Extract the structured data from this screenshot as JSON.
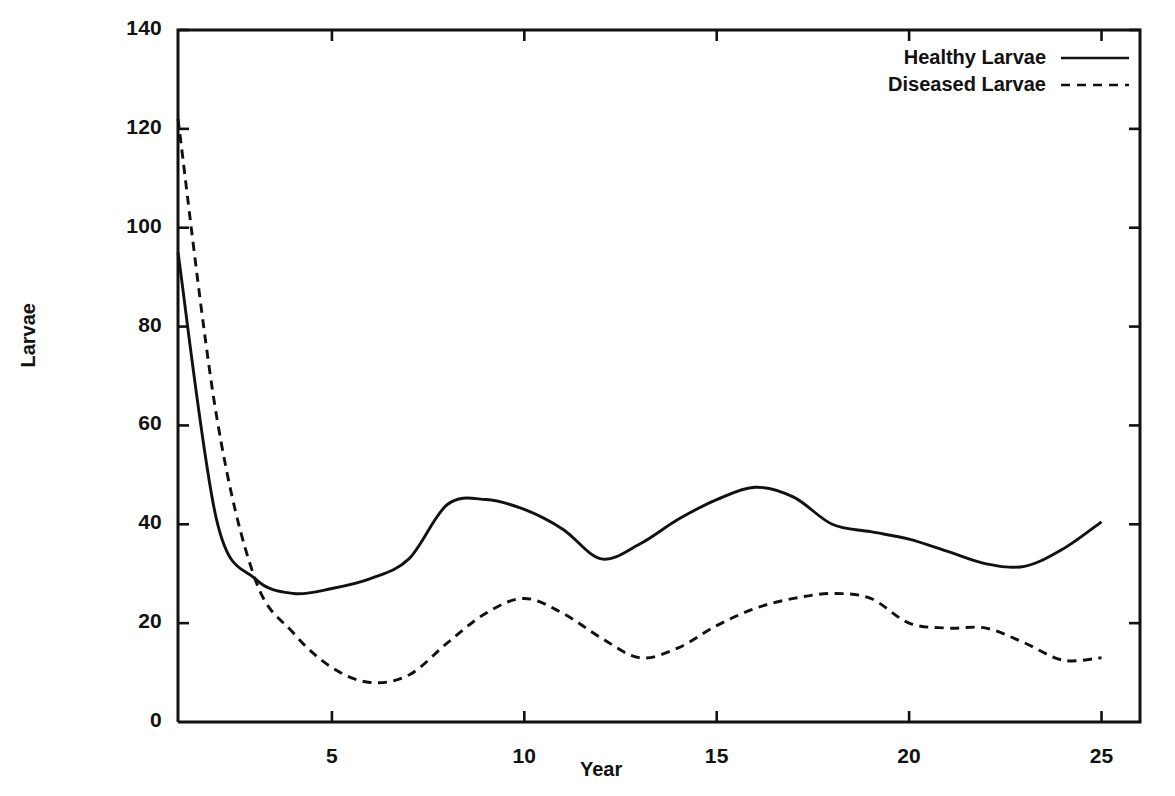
{
  "chart_data": {
    "type": "line",
    "title": "",
    "xlabel": "Year",
    "ylabel": "Larvae",
    "xlim": [
      1,
      26
    ],
    "ylim": [
      0,
      140
    ],
    "grid": false,
    "legend_position": "top-right",
    "x_ticks": [
      5,
      10,
      15,
      20,
      25
    ],
    "x_tick_labels": [
      "5",
      "10",
      "15",
      "20",
      "25"
    ],
    "y_ticks": [
      0,
      20,
      40,
      60,
      80,
      100,
      120,
      140
    ],
    "y_tick_labels": [
      "0",
      "20",
      "40",
      "60",
      "80",
      "100",
      "120",
      "140"
    ],
    "x": [
      1,
      2,
      3,
      4,
      5,
      6,
      7,
      8,
      9,
      10,
      11,
      12,
      13,
      14,
      15,
      16,
      17,
      18,
      19,
      20,
      21,
      22,
      23,
      24,
      25
    ],
    "series": [
      {
        "name": "Healthy Larvae",
        "style": "solid",
        "color": "#111111",
        "values": [
          95,
          41,
          29,
          26,
          27,
          29,
          33,
          44,
          45,
          43,
          39,
          33,
          36,
          41,
          45,
          47.5,
          45.5,
          40,
          38.5,
          37,
          34.5,
          32,
          31.5,
          35,
          40.5
        ]
      },
      {
        "name": "Diseased Larvae",
        "style": "dashed",
        "color": "#111111",
        "values": [
          122,
          62,
          29,
          18,
          11,
          8,
          9.5,
          16,
          22,
          25,
          22,
          17,
          13,
          15,
          19.5,
          23,
          25,
          26,
          25,
          20,
          19,
          19,
          16,
          12.5,
          13
        ]
      }
    ]
  },
  "legend": {
    "items": [
      {
        "label": "Healthy Larvae",
        "style": "solid"
      },
      {
        "label": "Diseased Larvae",
        "style": "dashed"
      }
    ]
  },
  "axes": {
    "y_title": "Larvae",
    "x_title": "Year"
  }
}
